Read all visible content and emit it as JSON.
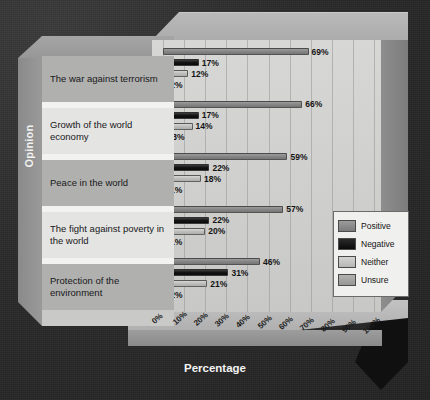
{
  "axes": {
    "y_title": "Opinion",
    "x_title": "Percentage"
  },
  "legend": {
    "items": [
      {
        "label": "Positive",
        "swatch": "positive",
        "color": "#868686"
      },
      {
        "label": "Negative",
        "swatch": "negative",
        "color": "#141414"
      },
      {
        "label": "Neither",
        "swatch": "neither",
        "color": "#bdbdbb"
      },
      {
        "label": "Unsure",
        "swatch": "unsure",
        "color": "#9e9e9c"
      }
    ]
  },
  "chart_data": {
    "type": "bar",
    "orientation": "horizontal",
    "title": "",
    "xlabel": "Percentage",
    "ylabel": "Opinion",
    "xlim": [
      0,
      100
    ],
    "xticks": [
      "0%",
      "10%",
      "20%",
      "30%",
      "40%",
      "50%",
      "60%",
      "70%",
      "80%",
      "90%",
      "100%"
    ],
    "grid": true,
    "legend_position": "lower-right",
    "categories": [
      "The war against terrorism",
      "Growth of the world economy",
      "Peace in the world",
      "The fight against poverty in the world",
      "Protection of the environment"
    ],
    "series": [
      {
        "name": "Positive",
        "values": [
          69,
          66,
          59,
          57,
          46
        ]
      },
      {
        "name": "Negative",
        "values": [
          17,
          17,
          22,
          22,
          31
        ]
      },
      {
        "name": "Neither",
        "values": [
          12,
          14,
          18,
          20,
          21
        ]
      },
      {
        "name": "Unsure",
        "values": [
          2,
          3,
          1,
          1,
          2
        ]
      }
    ],
    "data_labels": [
      [
        "69%",
        "17%",
        "12%",
        "2%"
      ],
      [
        "66%",
        "17%",
        "14%",
        "3%"
      ],
      [
        "59%",
        "22%",
        "18%",
        "1%"
      ],
      [
        "57%",
        "22%",
        "20%",
        "1%"
      ],
      [
        "46%",
        "31%",
        "21%",
        "2%"
      ]
    ]
  }
}
